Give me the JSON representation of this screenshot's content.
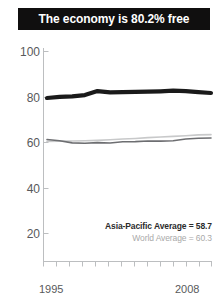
{
  "title": {
    "text": "The economy is 80.2% free"
  },
  "annotations": {
    "asia_pacific": "Asia-Pacific Average = 58.7",
    "world": "World Average = 60.3"
  },
  "axis": {
    "y_ticks": [
      "100",
      "80",
      "60",
      "40",
      "20"
    ],
    "x_start": "1995",
    "x_end": "2008"
  },
  "colors": {
    "banner_bg": "#100f0f",
    "banner_text": "#ffffff",
    "country_line": "#1a1a1a",
    "asia_line": "#6d6e71",
    "world_line": "#c8c9ca",
    "axis": "#bcbec0",
    "tick_text": "#58595b"
  },
  "chart_data": {
    "type": "line",
    "title": "The economy is 80.2% free",
    "xlabel": "",
    "ylabel": "",
    "xlim": [
      1995,
      2008
    ],
    "ylim": [
      0,
      100
    ],
    "grid": false,
    "legend_position": "inside-lower-right",
    "x": [
      1995,
      1996,
      1997,
      1998,
      1999,
      2000,
      2001,
      2002,
      2003,
      2004,
      2005,
      2006,
      2007,
      2008
    ],
    "y_ticks": [
      20,
      40,
      60,
      80,
      100
    ],
    "series": [
      {
        "name": "Country score",
        "style": "thick-black",
        "color": "#1a1a1a",
        "values": [
          77.8,
          78.3,
          78.6,
          79.2,
          81.1,
          80.5,
          80.6,
          80.7,
          80.8,
          81.0,
          81.3,
          81.1,
          80.6,
          80.2
        ]
      },
      {
        "name": "Asia-Pacific Average",
        "style": "thin-dark-gray",
        "color": "#6d6e71",
        "average_label": 58.7,
        "values": [
          58.0,
          57.4,
          56.4,
          56.2,
          56.5,
          56.3,
          56.9,
          57.0,
          57.3,
          57.2,
          57.4,
          58.2,
          58.6,
          58.7
        ]
      },
      {
        "name": "World Average",
        "style": "thin-light-gray",
        "color": "#c8c9ca",
        "average_label": 60.3,
        "values": [
          57.1,
          57.2,
          57.3,
          57.4,
          57.6,
          57.9,
          58.2,
          58.5,
          58.9,
          59.2,
          59.5,
          59.8,
          60.2,
          60.3
        ]
      }
    ]
  }
}
